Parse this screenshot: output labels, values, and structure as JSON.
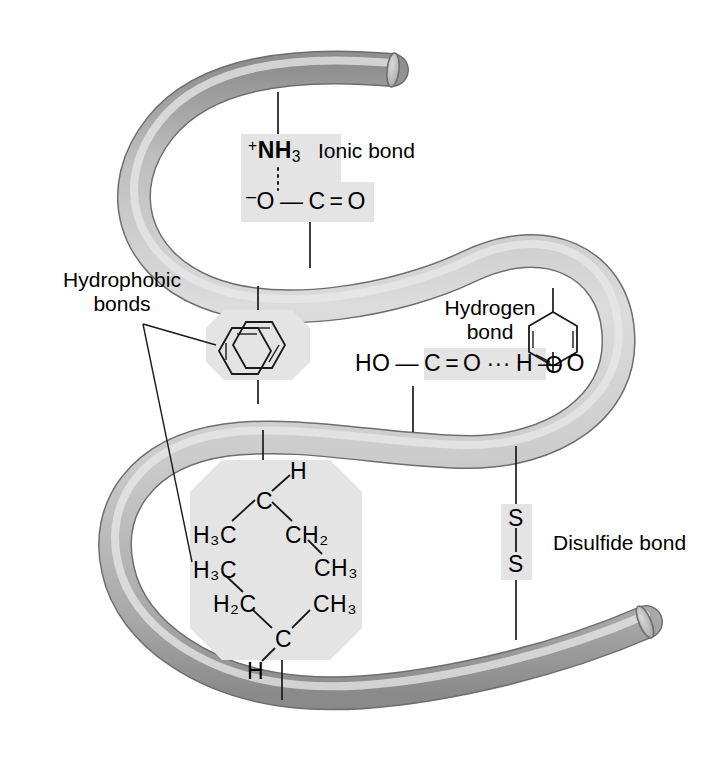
{
  "figure": {
    "background_color": "#ffffff",
    "ribbon_fill_color": "#c9c9c9",
    "ribbon_edge_color": "#7a7a7a",
    "highlight_color": "#e3e3e3",
    "line_color": "#1a1a1a"
  },
  "labels": {
    "ionic_bond": "Ionic bond",
    "hydrogen_bond_line1": "Hydrogen",
    "hydrogen_bond_line2": "bond",
    "hydrophobic_bonds_line1": "Hydrophobic",
    "hydrophobic_bonds_line2": "bonds",
    "disulfide_bond": "Disulfide bond"
  },
  "ionic_bond_group": {
    "top_label": "NH",
    "top_charge": "+",
    "top_subscript": "3",
    "bottom_o_charge": "–",
    "bottom_o": "O",
    "bottom_c": "C",
    "bottom_o2": "O",
    "single_bond": "—",
    "double_bond": "=",
    "dotted_bond": "⋮"
  },
  "hydrogen_bond_group": {
    "ho": "HO",
    "c": "C",
    "o": "O",
    "h": "H",
    "o2": "O",
    "single_bond": "—",
    "double_bond": "=",
    "dots": "···"
  },
  "disulfide_group": {
    "s_top": "S",
    "s_bottom": "S"
  },
  "leucine_group": {
    "top_h": "H",
    "top_c": "C",
    "top_left_ch3": "H₃C",
    "top_right_ch2": "CH₂",
    "top_right_ch3": "CH₃",
    "bottom_left_ch3": "H₃C",
    "bottom_left_ch2": "H₂C",
    "bottom_right_ch3": "CH₃",
    "bottom_c": "C",
    "bottom_h": "H",
    "atoms": [
      {
        "text": "H",
        "x": 297,
        "y": 468,
        "sub": ""
      },
      {
        "text": "C",
        "x": 263,
        "y": 500,
        "sub": ""
      },
      {
        "text": "H",
        "x": 196,
        "y": 535,
        "sub": "3",
        "suffix": "C"
      },
      {
        "text": "CH",
        "x": 288,
        "y": 535,
        "sub": "2"
      },
      {
        "text": "CH",
        "x": 317,
        "y": 568,
        "sub": "3"
      },
      {
        "text": "H",
        "x": 196,
        "y": 570,
        "sub": "3",
        "suffix": "C"
      },
      {
        "text": "H",
        "x": 216,
        "y": 604,
        "sub": "2",
        "suffix": "C"
      },
      {
        "text": "CH",
        "x": 316,
        "y": 604,
        "sub": "3"
      },
      {
        "text": "C",
        "x": 282,
        "y": 638,
        "sub": ""
      },
      {
        "text": "H",
        "x": 254,
        "y": 670,
        "sub": ""
      }
    ]
  },
  "aromatic_group": {
    "name": "stacked-aromatic-rings",
    "ring_count": 2
  },
  "phenol_group": {
    "name": "phenol-ring",
    "o": "O"
  }
}
